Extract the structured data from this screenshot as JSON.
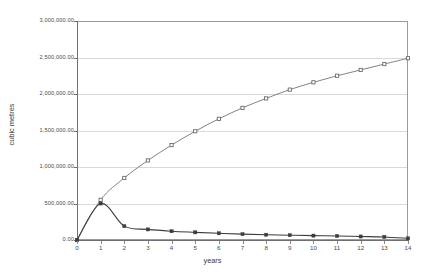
{
  "chart_data": {
    "type": "line",
    "title": "",
    "xlabel": "years",
    "ylabel": "cubic metres",
    "x": [
      0,
      1,
      2,
      3,
      4,
      5,
      6,
      7,
      8,
      9,
      10,
      11,
      12,
      13,
      14
    ],
    "xlim": [
      0,
      14
    ],
    "ylim": [
      0,
      3000000
    ],
    "ytick_values": [
      0,
      500000,
      1000000,
      1500000,
      2000000,
      2500000,
      3000000
    ],
    "ytick_labels": [
      "0.00",
      "500,000.00",
      "1,000,000.00",
      "1,500,000.00",
      "2,000,000.00",
      "2,500,000.00",
      "3,000,000.00"
    ],
    "xtick_labels": [
      "0",
      "1",
      "2",
      "3",
      "4",
      "5",
      "6",
      "7",
      "8",
      "9",
      "10",
      "11",
      "12",
      "13",
      "14"
    ],
    "grid": true,
    "legend": "none",
    "series": [
      {
        "name": "cumulative",
        "marker": "open-square",
        "color": "#6b6b6b",
        "values": [
          0,
          550000,
          850000,
          1090000,
          1300000,
          1490000,
          1660000,
          1810000,
          1940000,
          2060000,
          2160000,
          2250000,
          2330000,
          2410000,
          2490000
        ]
      },
      {
        "name": "annual",
        "marker": "filled-square",
        "color": "#3c3c3c",
        "values": [
          0,
          500000,
          190000,
          145000,
          120000,
          105000,
          92000,
          80000,
          72000,
          66000,
          60000,
          55000,
          48000,
          42000,
          22000
        ]
      }
    ]
  }
}
